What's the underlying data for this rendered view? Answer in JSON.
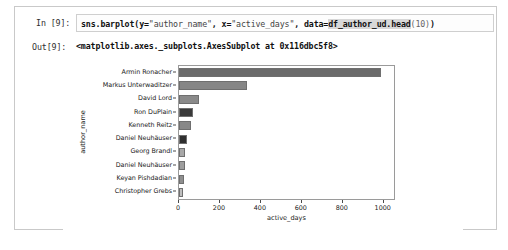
{
  "notebook": {
    "input_prompt": "In [9]:",
    "output_prompt": "Out[9]:",
    "code_parts": {
      "call": "sns.barplot(",
      "y_kw": "y=",
      "y_val": "\"author_name\"",
      "sep1": ", ",
      "x_kw": "x=",
      "x_val": "\"active_days\"",
      "sep2": ", ",
      "data_kw": "data=",
      "data_val": "df_author_ud.head",
      "head_arg": "(10)",
      "close": ")"
    },
    "code_full": "sns.barplot(y=\"author_name\", x=\"active_days\", data=df_author_ud.head(10))",
    "output_text": "<matplotlib.axes._subplots.AxesSubplot at 0x116dbc5f8>"
  },
  "chart_data": {
    "type": "bar",
    "orientation": "horizontal",
    "title": "",
    "xlabel": "active_days",
    "ylabel": "author_name",
    "categories": [
      "Armin Ronacher",
      "Markus Unterwaditzer",
      "David Lord",
      "Ron DuPlain",
      "Kenneth Reitz",
      "Daniel Neuhäuser",
      "Georg Brandl",
      "Daniel Neuhäuser",
      "Keyan Pishdadian",
      "Christopher Grebs"
    ],
    "values": [
      985,
      330,
      100,
      68,
      60,
      40,
      30,
      28,
      22,
      20
    ],
    "bar_colors": [
      "#6b6b6b",
      "#868686",
      "#8a8a8a",
      "#3a3a3a",
      "#888888",
      "#2f2f2f",
      "#a8a8a8",
      "#9e9e9e",
      "#8f8f8f",
      "#bfbfbf"
    ],
    "xlim": [
      0,
      1050
    ],
    "xticks": [
      0,
      200,
      400,
      600,
      800,
      1000
    ],
    "xtick_labels": [
      "0",
      "200",
      "400",
      "600",
      "800",
      "1000"
    ],
    "grid": false,
    "legend": "none"
  }
}
